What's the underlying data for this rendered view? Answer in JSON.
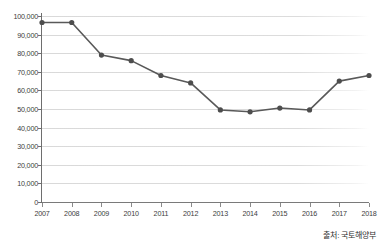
{
  "chart_data": {
    "type": "line",
    "title": "",
    "xlabel": "",
    "ylabel": "",
    "categories": [
      "2007",
      "2008",
      "2009",
      "2010",
      "2011",
      "2012",
      "2013",
      "2014",
      "2015",
      "2016",
      "2017",
      "2018"
    ],
    "values": [
      96500,
      96500,
      79000,
      76000,
      68000,
      64000,
      49500,
      48500,
      50500,
      49500,
      65000,
      68000
    ],
    "series": [
      {
        "name": "",
        "values": [
          96500,
          96500,
          79000,
          76000,
          68000,
          64000,
          49500,
          48500,
          50500,
          49500,
          65000,
          68000
        ]
      }
    ],
    "ylim": [
      0,
      100000
    ],
    "ytick_labels": [
      "0",
      "10,000",
      "20,000",
      "30,000",
      "40,000",
      "50,000",
      "60,000",
      "70,000",
      "80,000",
      "90,000",
      "100,000"
    ],
    "ytick_values": [
      0,
      10000,
      20000,
      30000,
      40000,
      50000,
      60000,
      70000,
      80000,
      90000,
      100000
    ],
    "grid": true,
    "legend": null,
    "legend_position": "none",
    "annotations": [
      "출처: 국토해양부"
    ],
    "line_color": "#595959",
    "marker_color": "#4d4d4d",
    "grid_color": "#d9d9d9",
    "axis_color": "#6e6e6e"
  },
  "source_note": "출처: 국토해양부"
}
